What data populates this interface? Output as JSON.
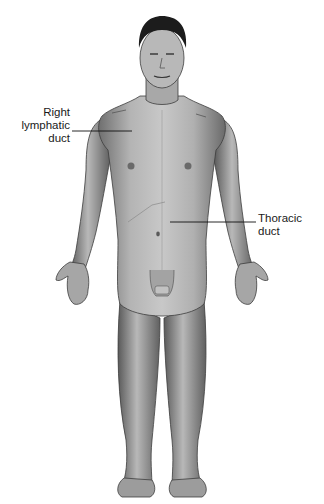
{
  "figure": {
    "labels": [
      {
        "id": "right-lymphatic-duct",
        "lines": [
          "Right",
          "lymphatic",
          "duct"
        ]
      },
      {
        "id": "thoracic-duct",
        "lines": [
          "Thoracic",
          "duct"
        ]
      }
    ]
  },
  "colors": {
    "background": "#ffffff",
    "skin_light": "#c9c9c9",
    "skin_mid": "#9a9a9a",
    "skin_dark": "#5e5e5e",
    "hair": "#1c1c1c",
    "text": "#1a1a1a",
    "leader_line": "#111111"
  }
}
